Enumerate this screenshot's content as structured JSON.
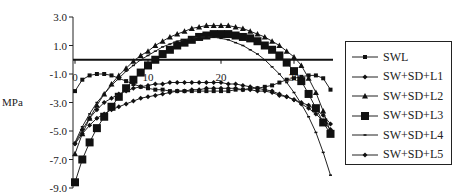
{
  "chart_data": {
    "type": "line",
    "title": "",
    "xlabel": "",
    "ylabel": "MPa",
    "xlim": [
      0,
      35
    ],
    "ylim": [
      -9.0,
      3.0
    ],
    "yticks": [
      "3.0",
      "1.0",
      "-1.0",
      "-3.0",
      "-5.0",
      "-7.0",
      "-9.0"
    ],
    "xticks": [
      "0",
      "10",
      "20",
      "30"
    ],
    "grid": false,
    "legend_position": "right",
    "x": [
      0,
      1,
      2,
      3,
      4,
      5,
      6,
      7,
      8,
      9,
      10,
      11,
      12,
      13,
      14,
      15,
      16,
      17,
      18,
      19,
      20,
      21,
      22,
      23,
      24,
      25,
      26,
      27,
      28,
      29,
      30,
      31,
      32,
      33,
      34,
      35
    ],
    "series": [
      {
        "name": "SWL",
        "marker": "small-square",
        "values": [
          -2.2,
          -1.4,
          -1.1,
          -1.0,
          -1.0,
          -1.1,
          -1.3,
          -1.5,
          -1.7,
          -1.9,
          -2.0,
          -2.1,
          -2.1,
          -2.2,
          -2.2,
          -2.2,
          -2.2,
          -2.2,
          -2.2,
          -2.2,
          -2.2,
          -2.2,
          -2.1,
          -2.1,
          -2.0,
          -2.0,
          -1.9,
          -1.8,
          -1.6,
          -1.4,
          -1.3,
          -1.2,
          -1.1,
          -1.1,
          -1.3,
          -2.1
        ]
      },
      {
        "name": "SW+SD+L1",
        "marker": "small-diamond",
        "values": [
          -5.9,
          -5.2,
          -4.6,
          -4.1,
          -3.8,
          -3.5,
          -3.3,
          -3.1,
          -2.9,
          -2.7,
          -2.6,
          -2.5,
          -2.4,
          -2.3,
          -2.2,
          -2.2,
          -2.1,
          -2.1,
          -2.0,
          -2.0,
          -2.0,
          -2.0,
          -2.0,
          -2.1,
          -2.1,
          -2.2,
          -2.2,
          -2.3,
          -2.5,
          -2.6,
          -2.8,
          -3.0,
          -3.2,
          -3.5,
          -3.9,
          -4.5
        ]
      },
      {
        "name": "SW+SD+L2",
        "marker": "triangle",
        "values": [
          -6.6,
          -5.2,
          -4.1,
          -3.2,
          -2.4,
          -1.7,
          -1.1,
          -0.6,
          -0.1,
          0.3,
          0.6,
          1.0,
          1.3,
          1.6,
          1.8,
          2.0,
          2.2,
          2.3,
          2.4,
          2.4,
          2.4,
          2.4,
          2.3,
          2.2,
          2.0,
          1.8,
          1.6,
          1.3,
          1.0,
          0.6,
          0.2,
          -0.4,
          -1.3,
          -2.3,
          -3.6,
          -5.1
        ]
      },
      {
        "name": "SW+SD+L3",
        "marker": "large-square",
        "values": [
          -8.6,
          -7.0,
          -5.8,
          -4.8,
          -4.0,
          -3.3,
          -2.6,
          -2.0,
          -1.4,
          -0.9,
          -0.4,
          0.0,
          0.4,
          0.7,
          1.0,
          1.2,
          1.4,
          1.6,
          1.7,
          1.8,
          1.8,
          1.8,
          1.7,
          1.6,
          1.5,
          1.3,
          1.0,
          0.7,
          0.3,
          -0.2,
          -0.8,
          -1.5,
          -2.4,
          -3.4,
          -4.4,
          -5.2
        ]
      },
      {
        "name": "SW+SD+L4",
        "marker": "dash",
        "values": [
          -5.8,
          -4.7,
          -3.8,
          -3.0,
          -2.4,
          -1.8,
          -1.3,
          -0.8,
          -0.4,
          0.0,
          0.3,
          0.6,
          0.9,
          1.1,
          1.3,
          1.4,
          1.5,
          1.6,
          1.6,
          1.6,
          1.5,
          1.4,
          1.2,
          1.0,
          0.7,
          0.4,
          0.0,
          -0.5,
          -1.0,
          -1.6,
          -2.3,
          -3.1,
          -4.0,
          -5.1,
          -6.5,
          -8.1
        ]
      },
      {
        "name": "SW+SD+L5",
        "marker": "small-diamond",
        "values": [
          -5.9,
          -4.9,
          -4.1,
          -3.5,
          -3.0,
          -2.7,
          -2.4,
          -2.2,
          -2.0,
          -1.9,
          -1.8,
          -1.7,
          -1.7,
          -1.6,
          -1.6,
          -1.6,
          -1.6,
          -1.6,
          -1.6,
          -1.6,
          -1.6,
          -1.7,
          -1.7,
          -1.8,
          -1.9,
          -2.0,
          -2.1,
          -2.2,
          -2.4,
          -2.6,
          -2.8,
          -3.1,
          -3.4,
          -3.8,
          -4.3,
          -4.9
        ]
      }
    ]
  },
  "legend": {
    "items": [
      {
        "label": "SWL",
        "marker": "small-square"
      },
      {
        "label": "SW+SD+L1",
        "marker": "small-diamond"
      },
      {
        "label": "SW+SD+L2",
        "marker": "triangle"
      },
      {
        "label": "SW+SD+L3",
        "marker": "large-square"
      },
      {
        "label": "SW+SD+L4",
        "marker": "dash"
      },
      {
        "label": "SW+SD+L5",
        "marker": "small-diamond"
      }
    ]
  },
  "axis": {
    "ylabel": "MPa"
  }
}
